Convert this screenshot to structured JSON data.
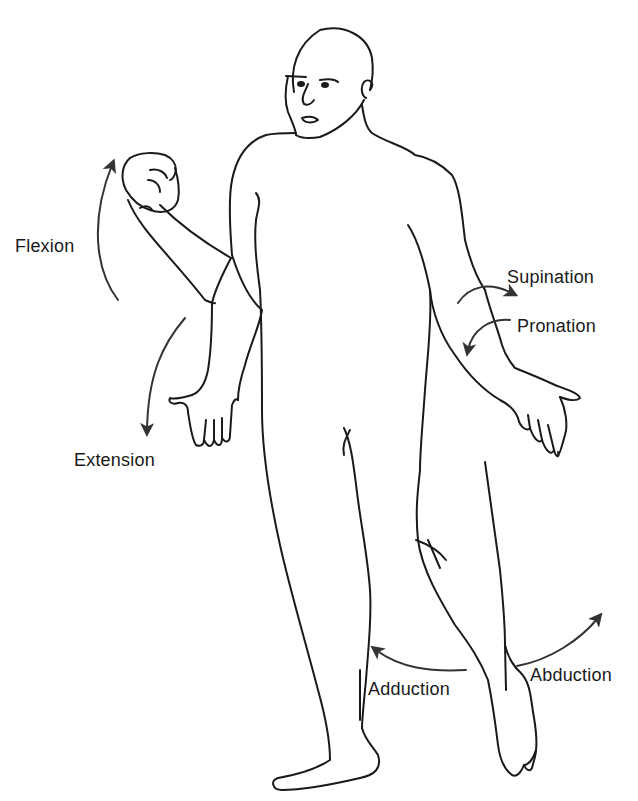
{
  "diagram": {
    "type": "anatomical-movements",
    "labels": {
      "flexion": "Flexion",
      "extension": "Extension",
      "supination": "Supination",
      "pronation": "Pronation",
      "adduction": "Adduction",
      "abduction": "Abduction"
    },
    "colors": {
      "line": "#1a1a1a",
      "arrow": "#333333",
      "background": "#ffffff"
    }
  }
}
